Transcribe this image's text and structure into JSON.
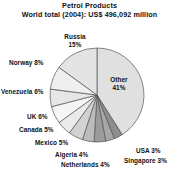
{
  "chart_data": {
    "type": "pie",
    "title": "Petrol Products",
    "subtitle": "World total (2004): US$ 496,092 million",
    "xlabel": "",
    "ylabel": "",
    "legend_position": "none",
    "grid": false,
    "unit": "percent",
    "total_value": "US$ 496,092 million",
    "year": "2004",
    "start_angle_deg": 0,
    "direction": "clockwise",
    "categories": [
      "Other",
      "USA",
      "Singapore",
      "Netherlands",
      "Algeria",
      "Mexico",
      "Canada",
      "UK",
      "Venezuela",
      "Norway",
      "Russia"
    ],
    "values": [
      41,
      3,
      3,
      4,
      4,
      5,
      5,
      6,
      6,
      8,
      15
    ],
    "labels": [
      "Other 41%",
      "USA 3%",
      "Singapore 3%",
      "Netherlands 4%",
      "Algeria 4%",
      "Mexico 5%",
      "Canada 5%",
      "UK 6%",
      "Venezuela 6%",
      "Norway 8%",
      "Russia 15%"
    ],
    "colors": [
      "#e0e0e0",
      "#8e8e8e",
      "#a8a8a8",
      "#9b9b9b",
      "#bcbcbc",
      "#d2d2d2",
      "#eaeaea",
      "#f5f5f5",
      "#e6e6e6",
      "#efefef",
      "#e4e4e4"
    ],
    "slice_stroke": "#555555",
    "label_color": "#111111"
  },
  "labels": {
    "other": "Other",
    "other_pct": "41%",
    "russia": "Russia",
    "russia_pct": "15%",
    "norway": "Norway 8%",
    "venezuela": "Venezuela 6%",
    "uk": "UK 6%",
    "canada": "Canada 5%",
    "mexico": "Mexico 5%",
    "algeria": "Algeria 4%",
    "netherlands": "Netherlands 4%",
    "usa": "USA 3%",
    "singapore": "Singapore 3%"
  }
}
